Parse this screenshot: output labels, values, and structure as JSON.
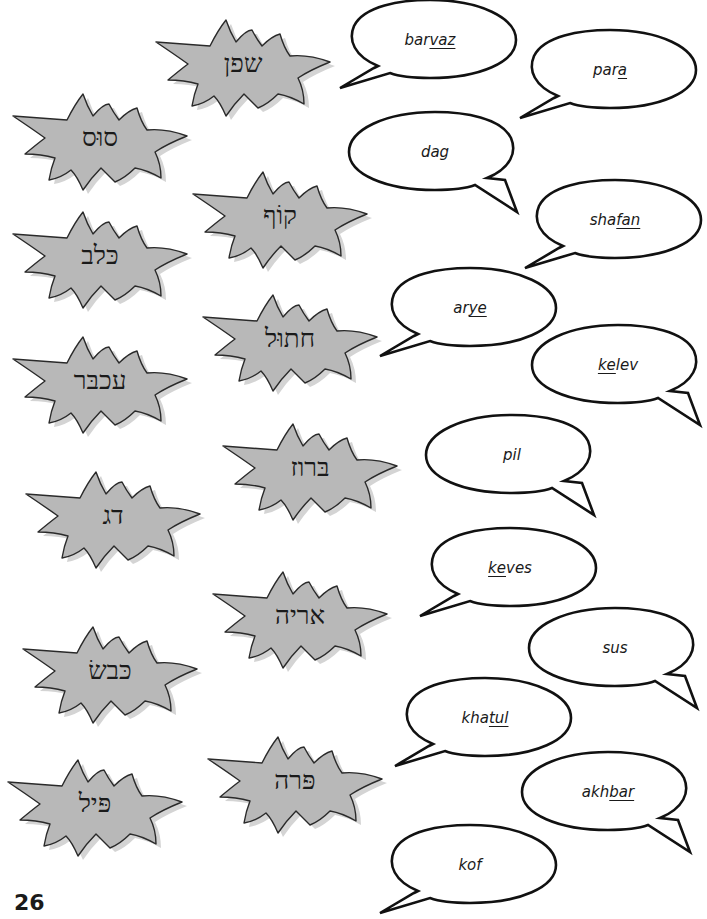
{
  "worksheet": {
    "hebrew_words": [
      {
        "id": "shafan",
        "text": "שפן",
        "x": 148,
        "y": 8
      },
      {
        "id": "sus",
        "text": "סוּס",
        "x": 5,
        "y": 82
      },
      {
        "id": "kof",
        "text": "קוֹף",
        "x": 185,
        "y": 160
      },
      {
        "id": "kelev",
        "text": "כּלב",
        "x": 5,
        "y": 200
      },
      {
        "id": "khatul",
        "text": "חתוּל",
        "x": 195,
        "y": 283
      },
      {
        "id": "akhbar",
        "text": "עכבּר",
        "x": 5,
        "y": 325
      },
      {
        "id": "barvaz",
        "text": "בּרוז",
        "x": 215,
        "y": 412
      },
      {
        "id": "dag",
        "text": "דג",
        "x": 18,
        "y": 460
      },
      {
        "id": "arye",
        "text": "אריה",
        "x": 205,
        "y": 560
      },
      {
        "id": "keves",
        "text": "כּבשׂ",
        "x": 15,
        "y": 615
      },
      {
        "id": "para",
        "text": "פּרה",
        "x": 200,
        "y": 725
      },
      {
        "id": "pil",
        "text": "פּיל",
        "x": 0,
        "y": 748
      }
    ],
    "transliterations": [
      {
        "id": "barvaz",
        "prefix": "bar",
        "underlined": "vaz",
        "suffix": "",
        "x": 340,
        "y": 0,
        "tail": "left"
      },
      {
        "id": "para",
        "prefix": "par",
        "underlined": "a",
        "suffix": "",
        "x": 520,
        "y": 30,
        "tail": "left"
      },
      {
        "id": "dag",
        "prefix": "dag",
        "underlined": "",
        "suffix": "",
        "x": 345,
        "y": 112,
        "tail": "right"
      },
      {
        "id": "shafan",
        "prefix": "sha",
        "underlined": "fan",
        "suffix": "",
        "x": 525,
        "y": 180,
        "tail": "left"
      },
      {
        "id": "arye",
        "prefix": "ar",
        "underlined": "ye",
        "suffix": "",
        "x": 380,
        "y": 268,
        "tail": "left"
      },
      {
        "id": "kelev",
        "prefix": "",
        "underlined": "ke",
        "suffix": "lev",
        "x": 528,
        "y": 325,
        "tail": "right"
      },
      {
        "id": "pil",
        "prefix": "pil",
        "underlined": "",
        "suffix": "",
        "x": 422,
        "y": 415,
        "tail": "right"
      },
      {
        "id": "keves",
        "prefix": "",
        "underlined": "ke",
        "suffix": "ves",
        "x": 420,
        "y": 528,
        "tail": "left"
      },
      {
        "id": "sus",
        "prefix": "sus",
        "underlined": "",
        "suffix": "",
        "x": 525,
        "y": 608,
        "tail": "right"
      },
      {
        "id": "khatul",
        "prefix": "kha",
        "underlined": "tul",
        "suffix": "",
        "x": 395,
        "y": 678,
        "tail": "left"
      },
      {
        "id": "akhbar",
        "prefix": "akh",
        "underlined": "bar",
        "suffix": "",
        "x": 518,
        "y": 752,
        "tail": "right"
      },
      {
        "id": "kof",
        "prefix": "kof",
        "underlined": "",
        "suffix": "",
        "x": 380,
        "y": 825,
        "tail": "left"
      }
    ],
    "page_number": "26"
  },
  "colors": {
    "burst_fill": "#b8b8b8",
    "burst_shadow": "#d4d4d4",
    "outline": "#2a2a2a",
    "bubble_fill": "#ffffff"
  }
}
